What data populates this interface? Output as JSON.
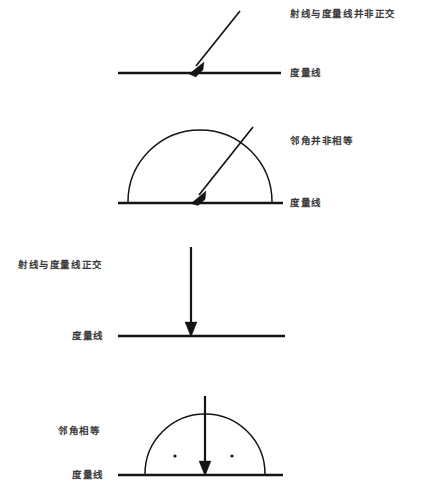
{
  "figure": {
    "title": "",
    "background_color": "#ffffff",
    "ink_color": "#141414",
    "text_color": "#3a3a3a",
    "panels": [
      {
        "id": "panel-1",
        "note_label": "射线与度量线并非正交",
        "baseline_label": "度量线",
        "note_position": "right",
        "baseline_label_position": "right",
        "has_arc": false,
        "has_dots": false,
        "ray_orientation": "oblique"
      },
      {
        "id": "panel-2",
        "note_label": "邻角并非相等",
        "baseline_label": "度量线",
        "note_position": "right",
        "baseline_label_position": "right",
        "has_arc": true,
        "has_dots": false,
        "ray_orientation": "oblique"
      },
      {
        "id": "panel-3",
        "note_label": "射线与度量线正交",
        "baseline_label": "度量线",
        "note_position": "left",
        "baseline_label_position": "left",
        "has_arc": false,
        "has_dots": false,
        "ray_orientation": "vertical"
      },
      {
        "id": "panel-4",
        "note_label": "邻角相等",
        "baseline_label": "度量线",
        "note_position": "left",
        "baseline_label_position": "left",
        "has_arc": true,
        "has_dots": true,
        "ray_orientation": "vertical"
      }
    ]
  }
}
